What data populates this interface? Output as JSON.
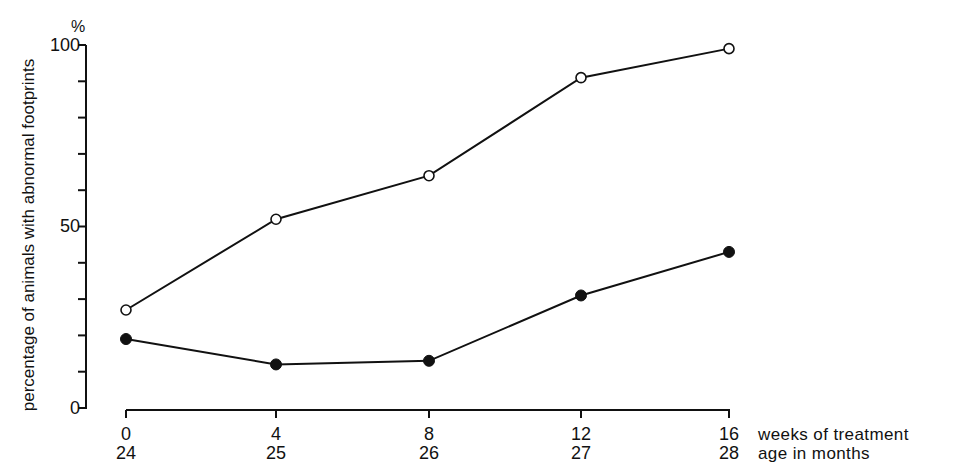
{
  "chart_data": {
    "type": "line",
    "title": "",
    "ylabel": "percentage of animals with abnormal footprints",
    "yunit": "%",
    "ylim": [
      0,
      100
    ],
    "yticks_major": [
      0,
      50,
      100
    ],
    "yticks_minor_step": 10,
    "xlabel_primary": "weeks of treatment",
    "xlabel_secondary": "age in months",
    "x": [
      0,
      4,
      8,
      12,
      16
    ],
    "x_secondary": [
      24,
      25,
      26,
      27,
      28
    ],
    "grid": false,
    "legend": null,
    "series": [
      {
        "name": "open circles",
        "marker": "open-circle",
        "values": [
          27,
          52,
          64,
          91,
          99
        ]
      },
      {
        "name": "filled circles",
        "marker": "filled-circle",
        "values": [
          19,
          12,
          13,
          31,
          43
        ]
      }
    ]
  },
  "labels": {
    "y_unit": "%",
    "y_title": "percentage of animals with abnormal footprints",
    "x_primary_title": "weeks of treatment",
    "x_secondary_title": "age in months",
    "ytick_0": "0",
    "ytick_50": "50",
    "ytick_100": "100"
  }
}
